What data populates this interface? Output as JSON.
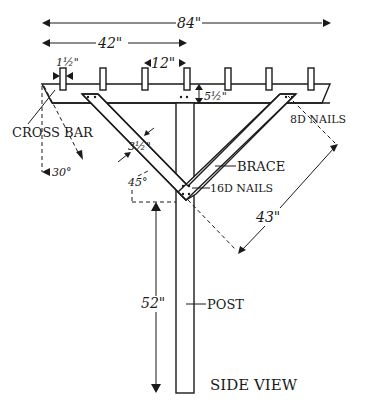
{
  "diagram": {
    "title": "SIDE VIEW",
    "dimensions": {
      "overall_width": "84\"",
      "half_width": "42\"",
      "slat_width": "1½\"",
      "slat_spacing": "12\"",
      "crossbar_height": "5½\"",
      "brace_width": "3½\"",
      "brace_length": "43\"",
      "post_height": "52\"",
      "crossbar_angle": "30°",
      "brace_angle": "45°"
    },
    "labels": {
      "cross_bar": "CROSS BAR",
      "brace": "BRACE",
      "post": "POST",
      "nails_8d": "8D NAILS",
      "nails_16d": "16D NAILS"
    },
    "colors": {
      "ink": "#1a1a1a",
      "background": "#ffffff"
    }
  }
}
